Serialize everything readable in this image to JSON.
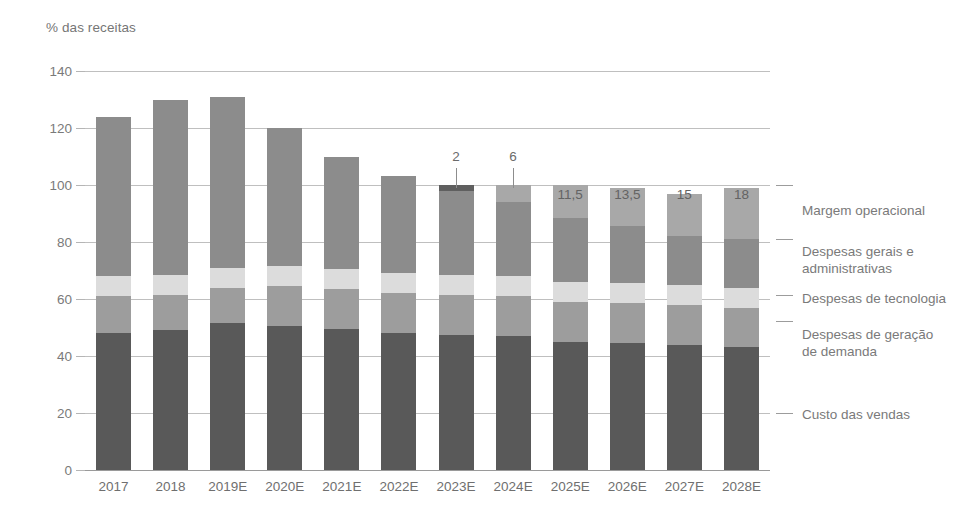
{
  "chart": {
    "axis_title": "% das receitas",
    "ylabel": "% das receitas"
  },
  "yaxis": {
    "ticks": [
      "140",
      "120",
      "100",
      "80",
      "60",
      "40",
      "20",
      "0"
    ]
  },
  "xaxis": {
    "labels": [
      "2017",
      "2018",
      "2019E",
      "2020E",
      "2021E",
      "2022E",
      "2023E",
      "2024E",
      "2025E",
      "2026E",
      "2027E",
      "2028E"
    ]
  },
  "legend": {
    "items": [
      {
        "label": "Margem operacional",
        "color": "#a8a8a8"
      },
      {
        "label": "Despesas gerais e\nadministrativas",
        "color": "#8c8c8c"
      },
      {
        "label": "Despesas de tecnologia",
        "color": "#dcdcdc"
      },
      {
        "label": "Despesas de geração\nde demanda",
        "color": "#9d9d9d"
      },
      {
        "label": "Custo das vendas",
        "color": "#595959"
      }
    ]
  },
  "value_labels": {
    "2023E": "2",
    "2024E": "6",
    "2025E": "11,5",
    "2026E": "13,5",
    "2027E": "15",
    "2028E": "18"
  },
  "chart_data": {
    "type": "bar",
    "stacked": true,
    "title": "",
    "subtitle": "",
    "xlabel": "",
    "ylabel": "% das receitas",
    "ylim": [
      0,
      140
    ],
    "yticks": [
      0,
      20,
      40,
      60,
      80,
      100,
      120,
      140
    ],
    "grid": true,
    "legend_position": "right",
    "categories": [
      "2017",
      "2018",
      "2019E",
      "2020E",
      "2021E",
      "2022E",
      "2023E",
      "2024E",
      "2025E",
      "2026E",
      "2027E",
      "2028E"
    ],
    "series": [
      {
        "name": "Custo das vendas",
        "color": "#595959",
        "values": [
          48,
          49,
          51.5,
          50.5,
          49.5,
          48,
          47.5,
          47,
          45,
          44.5,
          44,
          43
        ]
      },
      {
        "name": "Despesas de geração de demanda",
        "color": "#9d9d9d",
        "values": [
          13,
          12.5,
          12.5,
          14,
          14,
          14,
          14,
          14,
          14,
          14,
          14,
          14
        ]
      },
      {
        "name": "Despesas de tecnologia",
        "color": "#dcdcdc",
        "values": [
          7,
          7,
          7,
          7,
          7,
          7,
          7,
          7,
          7,
          7,
          7,
          7
        ]
      },
      {
        "name": "Despesas gerais e administrativas",
        "color": "#8c8c8c",
        "values": [
          56,
          61.5,
          60,
          48.5,
          39.5,
          34,
          29.5,
          26,
          22.5,
          20,
          17,
          17
        ]
      },
      {
        "name": "Margem operacional",
        "color": "#a8a8a8",
        "values": [
          0,
          0,
          0,
          0,
          0,
          0,
          2,
          6,
          11.5,
          13.5,
          15,
          18
        ]
      }
    ],
    "totals": [
      124,
      130,
      131,
      120,
      110,
      103,
      100,
      100,
      100,
      100,
      100,
      100
    ],
    "data_labels": {
      "series": "Margem operacional",
      "values": {
        "2023E": "2",
        "2024E": "6",
        "2025E": "11,5",
        "2026E": "13,5",
        "2027E": "15",
        "2028E": "18"
      }
    }
  }
}
